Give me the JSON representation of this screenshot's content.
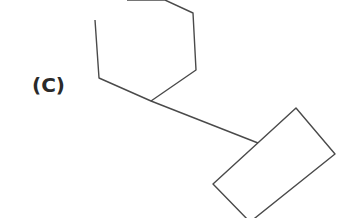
{
  "figure": {
    "label": "(C)",
    "stroke_color": "#4a4a4a",
    "background": "#ffffff",
    "shapes": [
      {
        "type": "hexagon",
        "points": "127,0 165,0 193,13 196,70 151,101 99,78 95,20"
      },
      {
        "type": "bond",
        "points": "151,101 258,143"
      },
      {
        "type": "rectangle",
        "points": "296,108 335,154 250,222 213,184"
      }
    ]
  }
}
